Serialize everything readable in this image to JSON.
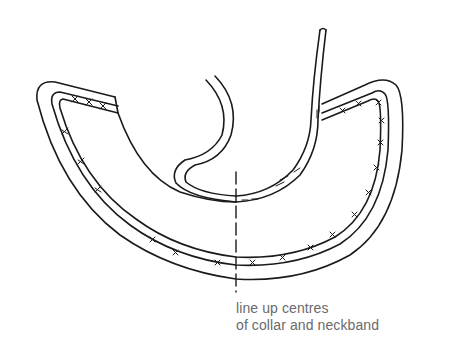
{
  "diagram": {
    "annotation": {
      "line1": "line up centres",
      "line2": "of collar and neckband"
    },
    "colors": {
      "stroke": "#1a1a1a",
      "text": "#6a6a6a",
      "background": "#ffffff"
    },
    "parts": [
      "neckband",
      "collar",
      "centre-line"
    ]
  }
}
